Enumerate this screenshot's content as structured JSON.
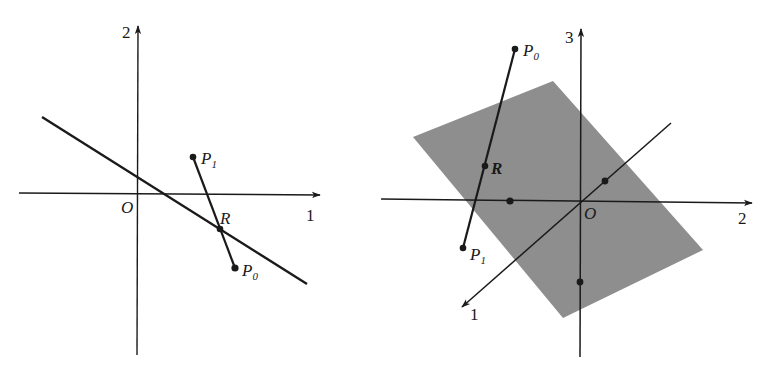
{
  "figures": [
    {
      "id": "left-2d",
      "description": "2D coordinate plane with a line and segment P1P0 intersecting it at R",
      "axes": {
        "horizontal_label": "1",
        "vertical_label": "2",
        "origin_label": "O"
      },
      "points": [
        {
          "name": "P1",
          "label": "P",
          "sub": "1"
        },
        {
          "name": "P0",
          "label": "P",
          "sub": "0"
        },
        {
          "name": "R",
          "label": "R",
          "sub": ""
        }
      ],
      "colors": {
        "ink": "#1a1a1a"
      }
    },
    {
      "id": "right-3d",
      "description": "3D coordinate system with a shaded plane and segment P0P1 piercing it at R",
      "axes": {
        "axis1_label": "1",
        "axis2_label": "2",
        "axis3_label": "3",
        "origin_label": "O"
      },
      "points": [
        {
          "name": "P0",
          "label": "P",
          "sub": "0"
        },
        {
          "name": "P1",
          "label": "P",
          "sub": "1"
        },
        {
          "name": "R",
          "label": "R",
          "sub": ""
        }
      ],
      "colors": {
        "ink": "#1a1a1a",
        "plane": "#8e8e8e"
      }
    }
  ]
}
